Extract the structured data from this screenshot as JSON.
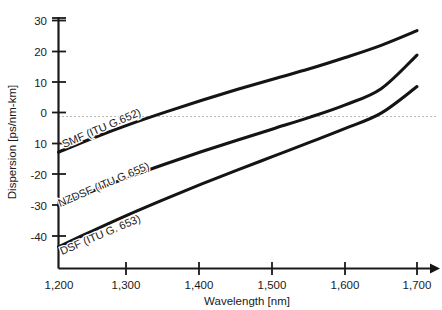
{
  "chart_data": {
    "type": "line",
    "title": "",
    "xlabel": "Wavelength [nm]",
    "ylabel": "Dispersion [ps/nm-km]",
    "xlim": [
      1200,
      1710
    ],
    "ylim": [
      -45,
      32
    ],
    "xticks": [
      1200,
      1300,
      1400,
      1500,
      1600,
      1700
    ],
    "xticklabels": [
      "1,200",
      "1,300",
      "1,400",
      "1,500",
      "1,600",
      "1,700"
    ],
    "yticks": [
      30,
      20,
      10,
      0,
      -10,
      -20,
      -30,
      -40
    ],
    "yticklabels": [
      "30",
      "20",
      "10",
      "0",
      "10",
      "-20",
      "-30",
      "-40"
    ],
    "grid": false,
    "legend_position": "inline-along-curves",
    "annotations": [
      {
        "text": "SMF (ITU G.652)",
        "x": 1215,
        "y": -11,
        "rotation": -23
      },
      {
        "text": "NZDSF (ITU G.655)",
        "x": 1218,
        "y": -28,
        "rotation": -23
      },
      {
        "text": "DSF (ITU G. 653)",
        "x": 1222,
        "y": -41,
        "rotation": -23
      }
    ],
    "zero_reference_line": 0,
    "series": [
      {
        "name": "SMF (ITU G.652)",
        "label": "SMF (ITU G.652)",
        "color": "#141414",
        "x": [
          1200,
          1250,
          1300,
          1350,
          1400,
          1450,
          1500,
          1550,
          1600,
          1650,
          1700
        ],
        "values": [
          -13.0,
          -8.2,
          -3.8,
          0.2,
          4.0,
          7.6,
          11.0,
          14.3,
          18.0,
          22.0,
          26.8
        ]
      },
      {
        "name": "NZDSF (ITU G.655)",
        "label": "NZDSF (ITU G.655)",
        "color": "#141414",
        "x": [
          1200,
          1250,
          1300,
          1350,
          1400,
          1450,
          1500,
          1550,
          1600,
          1650,
          1700
        ],
        "values": [
          -30.5,
          -25.5,
          -21.0,
          -16.8,
          -12.8,
          -9.0,
          -5.3,
          -1.6,
          2.5,
          7.8,
          18.8
        ]
      },
      {
        "name": "DSF (ITU G. 653)",
        "label": "DSF (ITU G. 653)",
        "color": "#141414",
        "x": [
          1200,
          1250,
          1300,
          1350,
          1400,
          1450,
          1500,
          1550,
          1600,
          1650,
          1700
        ],
        "values": [
          -44.0,
          -38.5,
          -33.2,
          -28.2,
          -23.4,
          -18.8,
          -14.3,
          -9.8,
          -5.2,
          -0.2,
          8.5
        ]
      }
    ]
  },
  "axes": {
    "x_title": "Wavelength [nm]",
    "y_title": "Dispersion [ps/nm-km]"
  },
  "ticks": {
    "x": [
      "1,200",
      "1,300",
      "1,400",
      "1,500",
      "1,600",
      "1,700"
    ],
    "y": [
      "30",
      "20",
      "10",
      "0",
      "10",
      "-20",
      "-30",
      "-40"
    ]
  },
  "curve_labels": {
    "smf": "SMF (ITU G.652)",
    "nzdsf": "NZDSF (ITU G.655)",
    "dsf": "DSF (ITU G. 653)"
  }
}
